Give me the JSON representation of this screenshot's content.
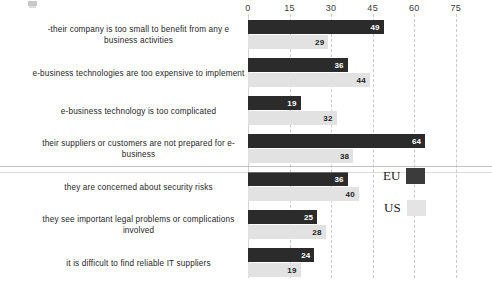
{
  "chart_data": {
    "type": "bar",
    "orientation": "horizontal",
    "title": "",
    "xlabel": "",
    "ylabel": "",
    "xlim": [
      0,
      75
    ],
    "xticks": [
      0,
      15,
      30,
      45,
      60,
      75
    ],
    "grid": true,
    "legend_position": "middle-right",
    "categories": [
      "-their company is too small to benefit from any e business activities",
      "e-business technologies are too expensive to implement",
      "e-business technology is too complicated",
      "their suppliers or customers are not prepared for e-business",
      "they are concerned about security risks",
      "they see important legal problems or complications involved",
      "it is difficult to find reliable IT suppliers"
    ],
    "series": [
      {
        "name": "EU",
        "color": "#2b2b2b",
        "values": [
          49,
          36,
          19,
          64,
          36,
          25,
          24
        ]
      },
      {
        "name": "US",
        "color": "#e2e2e2",
        "values": [
          29,
          44,
          32,
          38,
          40,
          28,
          19
        ]
      }
    ]
  },
  "axis": {
    "ticks": [
      {
        "label": "0",
        "value": 0
      },
      {
        "label": "15",
        "value": 15
      },
      {
        "label": "30",
        "value": 30
      },
      {
        "label": "45",
        "value": 45
      },
      {
        "label": "60",
        "value": 60
      },
      {
        "label": "75",
        "value": 75
      }
    ]
  },
  "legend": {
    "items": [
      {
        "label": "EU",
        "swatch": "dark"
      },
      {
        "label": "US",
        "swatch": "light"
      }
    ]
  }
}
